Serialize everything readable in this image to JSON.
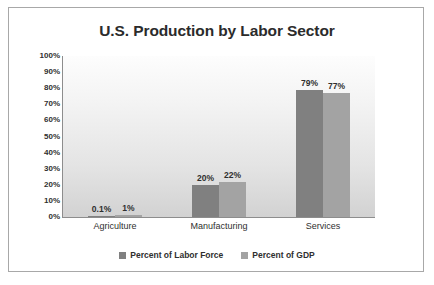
{
  "frame": {
    "border_color": "#a8a8a8",
    "page_background": "#ffffff"
  },
  "chart_data": {
    "type": "bar",
    "title": "U.S. Production by Labor Sector",
    "xlabel": "",
    "ylabel": "",
    "ylim": [
      0,
      100
    ],
    "ytick_labels": [
      "100%",
      "90%",
      "80%",
      "70%",
      "60%",
      "50%",
      "40%",
      "30%",
      "20%",
      "10%",
      "0%"
    ],
    "ytick_values": [
      100,
      90,
      80,
      70,
      60,
      50,
      40,
      30,
      20,
      10,
      0
    ],
    "grid": false,
    "legend_position": "bottom",
    "categories": [
      "Agriculture",
      "Manufacturing",
      "Services"
    ],
    "series": [
      {
        "name": "Percent of Labor Force",
        "color": "#808080",
        "values": [
          0.1,
          20,
          79
        ],
        "labels": [
          "0.1%",
          "20%",
          "79%"
        ]
      },
      {
        "name": "Percent of GDP",
        "color": "#a3a3a3",
        "values": [
          1,
          22,
          77
        ],
        "labels": [
          "1%",
          "22%",
          "77%"
        ]
      }
    ]
  }
}
